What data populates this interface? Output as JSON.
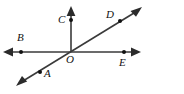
{
  "figure": {
    "width": 184,
    "height": 94,
    "background_color": "#ffffff",
    "stroke_color": "#3a3a3a",
    "label_color": "#111111",
    "dot_color": "#111111",
    "labels": {
      "A": "A",
      "B": "B",
      "C": "C",
      "D": "D",
      "E": "E",
      "O": "O"
    },
    "points": [
      {
        "name": "A",
        "label": "A",
        "dot_x": 40,
        "dot_y": 72,
        "label_x": 45,
        "label_y": 71
      },
      {
        "name": "B",
        "label": "B",
        "dot_x": 21,
        "dot_y": 52,
        "label_x": 17,
        "label_y": 33
      },
      {
        "name": "C",
        "label": "C",
        "dot_x": 71,
        "dot_y": 20,
        "label_x": 58,
        "label_y": 14
      },
      {
        "name": "D",
        "label": "D",
        "dot_x": 120,
        "dot_y": 21,
        "label_x": 106,
        "label_y": 9
      },
      {
        "name": "E",
        "label": "E",
        "dot_x": 124,
        "dot_y": 52,
        "label_x": 119,
        "label_y": 58
      },
      {
        "name": "O",
        "label": "O",
        "dot_x": 71,
        "dot_y": 52,
        "label_x": 66,
        "label_y": 55
      }
    ],
    "lines": [
      {
        "name": "horizontal-line",
        "x1": 4,
        "y1": 52,
        "x2": 140,
        "y2": 52,
        "arrow_start": true,
        "arrow_end": true
      },
      {
        "name": "vertical-ray",
        "x1": 71,
        "y1": 52,
        "x2": 71,
        "y2": 8,
        "arrow_start": false,
        "arrow_end": true
      },
      {
        "name": "diagonal-line",
        "x1": 18,
        "y1": 84,
        "x2": 140,
        "y2": 9,
        "arrow_start": true,
        "arrow_end": true
      }
    ]
  }
}
